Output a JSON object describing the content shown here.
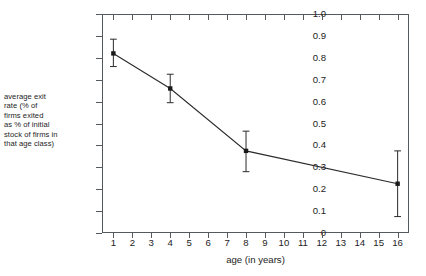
{
  "chart_data": {
    "type": "line",
    "title": "",
    "subtitle": "",
    "xlabel": "age (in years)",
    "ylabel": "average exit rate (% of firms exited as % of initial stock of firms in that age class)",
    "ylabel_lines": [
      "average exit",
      "rate (% of",
      "firms exited",
      "as % of initial",
      "stock of firms in",
      "that age class)"
    ],
    "x": [
      1,
      4,
      8,
      16
    ],
    "values": [
      0.82,
      0.66,
      0.375,
      0.225
    ],
    "error_low": [
      0.76,
      0.595,
      0.28,
      0.075
    ],
    "error_high": [
      0.885,
      0.725,
      0.465,
      0.375
    ],
    "series": [
      {
        "name": "average exit rate",
        "values": [
          0.82,
          0.66,
          0.375,
          0.225
        ]
      }
    ],
    "xlim": [
      0.4,
      16.6
    ],
    "ylim": [
      0,
      1.0
    ],
    "xticks": [
      1,
      2,
      3,
      4,
      5,
      6,
      7,
      8,
      9,
      10,
      11,
      12,
      13,
      14,
      15,
      16
    ],
    "xtick_labels": [
      "1",
      "2",
      "3",
      "4",
      "5",
      "6",
      "7",
      "8",
      "9",
      "10",
      "11",
      "12",
      "13",
      "14",
      "15",
      "16"
    ],
    "yticks": [
      0,
      0.1,
      0.2,
      0.3,
      0.4,
      0.5,
      0.6,
      0.7,
      0.8,
      0.9,
      1.0
    ],
    "ytick_labels": [
      "0",
      "0.1",
      "0.2",
      "0.3",
      "0.4",
      "0.5",
      "0.6",
      "0.7",
      "0.8",
      "0.9",
      "1.0"
    ],
    "grid": false,
    "legend": false,
    "legend_position": "none",
    "marker": "square",
    "error_bars": true,
    "line_color": "#2b2b2b",
    "marker_color": "#1a1a1a",
    "frame_color": "#555a5e",
    "background_color": "#ffffff"
  }
}
